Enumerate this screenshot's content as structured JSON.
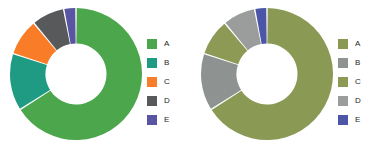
{
  "figure": {
    "background": "#ffffff",
    "panel_count": 2
  },
  "chart_data": [
    {
      "type": "pie",
      "variant": "donut",
      "title": "",
      "subtitle": "",
      "xlabel": "",
      "ylabel": "",
      "legend_position": "right",
      "grid": false,
      "start_angle_deg": 0,
      "direction": "clockwise",
      "inner_radius_ratio": 0.46,
      "categories": [
        "A",
        "B",
        "C",
        "D",
        "E"
      ],
      "values": [
        66,
        14,
        9,
        8,
        3
      ],
      "colors": [
        "#4ca74c",
        "#1f9b83",
        "#f97d28",
        "#58595b",
        "#5a55a3"
      ],
      "caption": "",
      "legend": [
        {
          "label": "A",
          "color": "#4ca74c"
        },
        {
          "label": "B",
          "color": "#1f9b83"
        },
        {
          "label": "C",
          "color": "#f97d28"
        },
        {
          "label": "D",
          "color": "#58595b"
        },
        {
          "label": "E",
          "color": "#5a55a3"
        }
      ]
    },
    {
      "type": "pie",
      "variant": "donut",
      "title": "",
      "subtitle": "",
      "xlabel": "",
      "ylabel": "",
      "legend_position": "right",
      "grid": false,
      "start_angle_deg": 0,
      "direction": "clockwise",
      "inner_radius_ratio": 0.46,
      "categories": [
        "A",
        "B",
        "C",
        "D",
        "E"
      ],
      "values": [
        66,
        14,
        9,
        8,
        3
      ],
      "colors": [
        "#8a9a54",
        "#8e9290",
        "#8c9a56",
        "#9a9d9c",
        "#4b56a8"
      ],
      "caption": "",
      "legend": [
        {
          "label": "A",
          "color": "#8a9a54"
        },
        {
          "label": "B",
          "color": "#8e9290"
        },
        {
          "label": "C",
          "color": "#8c9a56"
        },
        {
          "label": "D",
          "color": "#9a9d9c"
        },
        {
          "label": "E",
          "color": "#4b56a8"
        }
      ]
    }
  ]
}
